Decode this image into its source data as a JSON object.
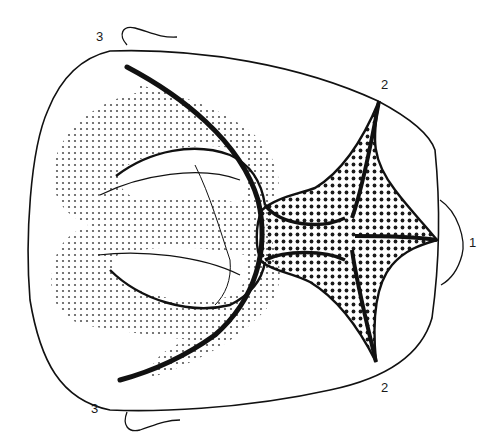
{
  "figure": {
    "type": "anatomical line diagram",
    "ink_color": "#111111",
    "fine_stipple_color": "#555555",
    "coarse_stipple_color": "#1a1a1a",
    "background": "#ffffff",
    "labels": [
      {
        "id": "label-3-top",
        "text": "3",
        "x": 96,
        "y": 30
      },
      {
        "id": "label-2-top",
        "text": "2",
        "x": 381,
        "y": 78
      },
      {
        "id": "label-1",
        "text": "1",
        "x": 469,
        "y": 236
      },
      {
        "id": "label-2-bottom",
        "text": "2",
        "x": 381,
        "y": 381
      },
      {
        "id": "label-3-bottom",
        "text": "3",
        "x": 91,
        "y": 402
      }
    ]
  }
}
